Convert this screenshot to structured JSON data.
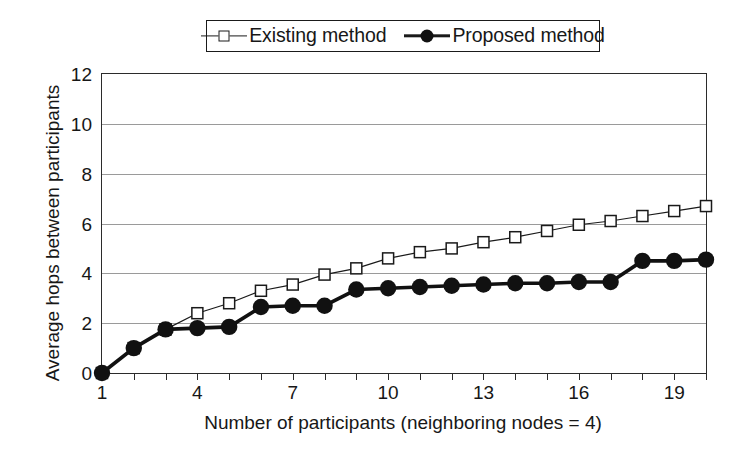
{
  "chart_data": {
    "type": "line",
    "title": "",
    "xlabel": "Number of participants (neighboring nodes = 4)",
    "ylabel": "Average hops between participants",
    "x": [
      1,
      2,
      3,
      4,
      5,
      6,
      7,
      8,
      9,
      10,
      11,
      12,
      13,
      14,
      15,
      16,
      17,
      18,
      19,
      20
    ],
    "xlim": [
      1,
      20
    ],
    "ylim": [
      0,
      12
    ],
    "ytick_labels": [
      "0",
      "2",
      "4",
      "6",
      "8",
      "10",
      "12"
    ],
    "ytick_values": [
      0,
      2,
      4,
      6,
      8,
      10,
      12
    ],
    "xtick_labels": [
      "1",
      "4",
      "7",
      "10",
      "13",
      "16",
      "19"
    ],
    "xtick_values": [
      1,
      4,
      7,
      10,
      13,
      16,
      19
    ],
    "grid": "horizontal",
    "legend_position": "top-center",
    "series": [
      {
        "name": "Existing method",
        "marker": "open-square",
        "values": [
          0,
          1.0,
          1.75,
          2.4,
          2.8,
          3.3,
          3.55,
          3.95,
          4.2,
          4.6,
          4.85,
          5.0,
          5.25,
          5.45,
          5.7,
          5.95,
          6.1,
          6.3,
          6.5,
          6.7
        ]
      },
      {
        "name": "Proposed method",
        "marker": "filled-circle",
        "values": [
          0,
          1.0,
          1.75,
          1.8,
          1.85,
          2.65,
          2.7,
          2.7,
          3.35,
          3.4,
          3.45,
          3.5,
          3.55,
          3.6,
          3.6,
          3.65,
          3.65,
          4.5,
          4.5,
          4.55
        ]
      }
    ],
    "colors": {
      "existing_line": "#1a1a1a",
      "proposed_line": "#111111",
      "grid": "#9a9a9a",
      "frame": "#2b2b2b",
      "text": "#171717",
      "background": "#ffffff"
    }
  },
  "legend": {
    "entries": [
      {
        "label": "Existing method"
      },
      {
        "label": "Proposed method"
      }
    ]
  },
  "axes": {
    "x_title": "Number of participants (neighboring nodes = 4)",
    "y_title": "Average hops between participants"
  }
}
